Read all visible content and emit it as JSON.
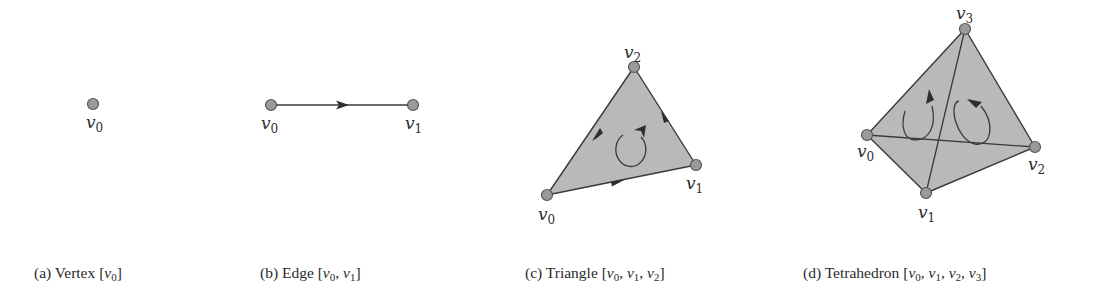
{
  "figure": {
    "panels": [
      {
        "id": "a",
        "caption_prefix": "(a) Vertex",
        "simplex": "Vertex",
        "vertices": [
          {
            "name": "v",
            "sub": "0"
          }
        ],
        "caption_list": [
          {
            "name": "v",
            "sub": "0"
          }
        ]
      },
      {
        "id": "b",
        "caption_prefix": "(b) Edge",
        "simplex": "Edge",
        "vertices": [
          {
            "name": "v",
            "sub": "0"
          },
          {
            "name": "v",
            "sub": "1"
          }
        ],
        "caption_list": [
          {
            "name": "v",
            "sub": "0"
          },
          {
            "name": "v",
            "sub": "1"
          }
        ]
      },
      {
        "id": "c",
        "caption_prefix": "(c) Triangle",
        "simplex": "Triangle",
        "vertices": [
          {
            "name": "v",
            "sub": "0"
          },
          {
            "name": "v",
            "sub": "1"
          },
          {
            "name": "v",
            "sub": "2"
          }
        ],
        "caption_list": [
          {
            "name": "v",
            "sub": "0"
          },
          {
            "name": "v",
            "sub": "1"
          },
          {
            "name": "v",
            "sub": "2"
          }
        ]
      },
      {
        "id": "d",
        "caption_prefix": "(d) Tetrahedron",
        "simplex": "Tetrahedron",
        "vertices": [
          {
            "name": "v",
            "sub": "0"
          },
          {
            "name": "v",
            "sub": "1"
          },
          {
            "name": "v",
            "sub": "2"
          },
          {
            "name": "v",
            "sub": "3"
          }
        ],
        "caption_list": [
          {
            "name": "v",
            "sub": "0"
          },
          {
            "name": "v",
            "sub": "1"
          },
          {
            "name": "v",
            "sub": "2"
          },
          {
            "name": "v",
            "sub": "3"
          }
        ]
      }
    ],
    "colors": {
      "face_fill": "#b9b9b9",
      "vertex_fill": "#9a9a9a",
      "stroke": "#3a3a3a"
    }
  }
}
